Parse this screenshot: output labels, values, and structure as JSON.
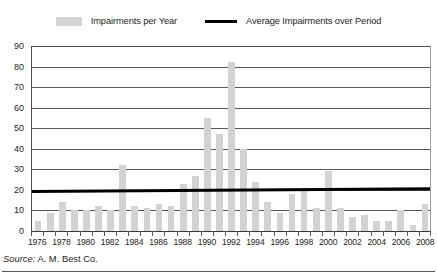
{
  "legend": {
    "items": [
      {
        "label": "Impairments per Year",
        "marker": "bar-swatch-icon",
        "color": "#d3d3d3"
      },
      {
        "label": "Average Impairments over Period",
        "marker": "line-swatch-icon",
        "color": "#000000"
      }
    ]
  },
  "source": {
    "prefix": "Source:",
    "text": "A. M. Best Co."
  },
  "chart_data": {
    "type": "bar",
    "title": "",
    "subtitle": "",
    "xlabel": "",
    "ylabel": "",
    "ylim": [
      0,
      90
    ],
    "ytick_step": 10,
    "yticks": [
      90,
      80,
      70,
      60,
      50,
      40,
      30,
      20,
      10,
      0
    ],
    "ytick_labels": [
      "90",
      "80",
      "70",
      "60",
      "50",
      "40",
      "30",
      "20",
      "10",
      "0"
    ],
    "grid": true,
    "legend_position": "top-center",
    "categories": [
      "1976",
      "1977",
      "1978",
      "1979",
      "1980",
      "1981",
      "1982",
      "1983",
      "1984",
      "1985",
      "1986",
      "1987",
      "1988",
      "1989",
      "1990",
      "1991",
      "1992",
      "1993",
      "1994",
      "1995",
      "1996",
      "1997",
      "1998",
      "1999",
      "2000",
      "2001",
      "2002",
      "2003",
      "2004",
      "2005",
      "2006",
      "2007",
      "2008"
    ],
    "xtick_labels": [
      "1976",
      "",
      "1978",
      "",
      "1980",
      "",
      "1982",
      "",
      "1984",
      "",
      "1986",
      "",
      "1988",
      "",
      "1990",
      "",
      "1992",
      "",
      "1994",
      "",
      "1996",
      "",
      "1998",
      "",
      "2000",
      "",
      "2002",
      "",
      "2004",
      "",
      "2006",
      "",
      "2008"
    ],
    "series": [
      {
        "name": "Impairments per Year",
        "type": "bar",
        "color": "#d3d3d3",
        "values": [
          5,
          9,
          14,
          10,
          10,
          12,
          10,
          32,
          12,
          11,
          13,
          12,
          23,
          27,
          55,
          47,
          82,
          40,
          24,
          14,
          9,
          18,
          20,
          11,
          29,
          11,
          7,
          8,
          5,
          5,
          10,
          3,
          13
        ]
      },
      {
        "name": "Average Impairments over Period",
        "type": "line",
        "color": "#000000",
        "values_endpoints": [
          19.2,
          20.6
        ],
        "average": 19.9
      }
    ]
  }
}
